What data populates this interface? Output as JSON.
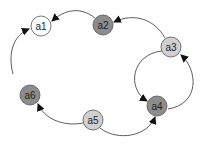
{
  "colors": {
    "edge": "#333333",
    "node_stroke": "#555555",
    "white": "#ffffff",
    "light": "#d0d0d0",
    "dark": "#8c8c8c"
  },
  "nodes": [
    {
      "id": "a1",
      "label": "a1",
      "x": 41,
      "y": 26,
      "fill": "white"
    },
    {
      "id": "a2",
      "label": "a2",
      "x": 103,
      "y": 25,
      "fill": "dark"
    },
    {
      "id": "a3",
      "label": "a3",
      "x": 171,
      "y": 47,
      "fill": "light"
    },
    {
      "id": "a4",
      "label": "a4",
      "x": 157,
      "y": 106,
      "fill": "dark"
    },
    {
      "id": "a5",
      "label": "a5",
      "x": 93,
      "y": 120,
      "fill": "light"
    },
    {
      "id": "a6",
      "label": "a6",
      "x": 30,
      "y": 95,
      "fill": "dark"
    }
  ],
  "edges": [
    {
      "from": "a2",
      "to": "a1"
    },
    {
      "from": "a3",
      "to": "a2"
    },
    {
      "from": "a6",
      "to": "a1"
    },
    {
      "from": "a5",
      "to": "a6"
    },
    {
      "from": "a5",
      "to": "a4"
    },
    {
      "from": "a3",
      "to": "a4"
    },
    {
      "from": "a4",
      "to": "a3"
    }
  ]
}
